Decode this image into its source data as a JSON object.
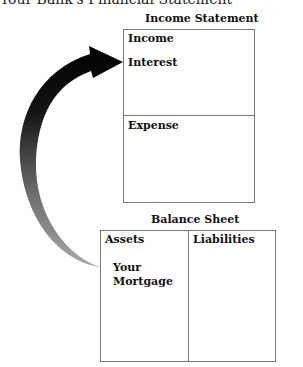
{
  "header": {
    "caption": "Your Bank's Financial Statement"
  },
  "income_statement": {
    "title": "Income Statement",
    "income_section": {
      "label": "Income",
      "items": [
        "Interest"
      ]
    },
    "expense_section": {
      "label": "Expense"
    }
  },
  "balance_sheet": {
    "title": "Balance Sheet",
    "assets_section": {
      "label": "Assets",
      "items": [
        "Your",
        "Mortgage"
      ]
    },
    "liabilities_section": {
      "label": "Liabilities"
    }
  },
  "arrow": {
    "from": "Your Mortgage",
    "to": "Interest",
    "gradient_start": "#9a9a9a",
    "gradient_end": "#000000"
  }
}
